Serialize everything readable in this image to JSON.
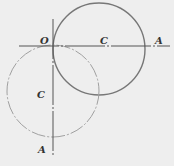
{
  "diagram": {
    "labels": {
      "origin": "O",
      "h_center": "C",
      "h_end": "A",
      "v_center": "C",
      "v_end": "A"
    },
    "colors": {
      "background": "#eeeeee",
      "solid_circle": "#777777",
      "dashed_circle": "#999999",
      "axis": "#555555"
    }
  }
}
